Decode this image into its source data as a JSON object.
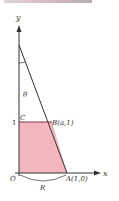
{
  "figure": {
    "axes": {
      "x_label": "x",
      "y_label": "y"
    },
    "points": {
      "origin": "O",
      "A": "A(1,0)",
      "B": "B(a,1)",
      "C": "C",
      "y_tick": "1"
    },
    "angle_label": "θ",
    "region_label": "R",
    "colors": {
      "shaded_region": "#f4b6bf",
      "lines": "#333333"
    }
  }
}
